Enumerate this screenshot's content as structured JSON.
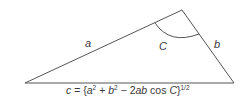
{
  "diagram": {
    "type": "triangle",
    "vertices": {
      "bottom_left": [
        25,
        83
      ],
      "apex": [
        182,
        10
      ],
      "bottom_right": [
        234,
        83
      ]
    },
    "labels": {
      "side_a": "a",
      "side_b": "b",
      "angle_C": "C"
    },
    "formula": {
      "lhs": "c",
      "equals": "=",
      "open": "{",
      "a": "a",
      "a_exp": "2",
      "plus": "+",
      "b": "b",
      "b_exp": "2",
      "minus": "−",
      "coef": "2",
      "ab": "ab",
      "cos": "cos",
      "C": "C",
      "close": "}",
      "exponent": "1/2"
    },
    "colors": {
      "stroke": "#555555",
      "text": "#3a3a3a"
    }
  }
}
